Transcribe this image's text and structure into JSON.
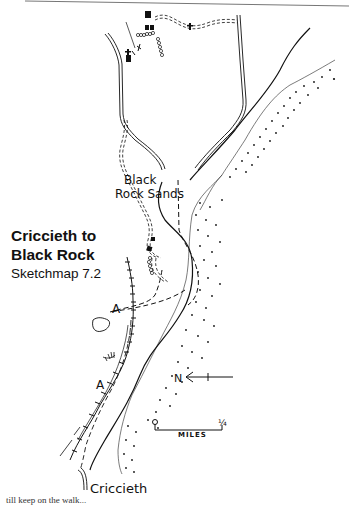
{
  "map": {
    "title": [
      "Criccieth to",
      "Black Rock"
    ],
    "subtitle": "Sketchmap 7.2",
    "labels": {
      "beach": [
        "Black",
        "Rock Sands"
      ],
      "town": "Criccieth",
      "route_marks": [
        "A",
        "A"
      ],
      "north": "N"
    },
    "scale": {
      "start": "o",
      "end": "¼",
      "unit": "MILES"
    },
    "legend_symbols": [
      "church-cross",
      "building",
      "stile",
      "road-double-line",
      "track-dashed",
      "footpath-dashed",
      "railway",
      "beach-dots",
      "north-arrow"
    ],
    "colors": {
      "ink": "#111111",
      "paper": "#ffffff"
    },
    "clipped_text": "till keep on the walk..."
  }
}
